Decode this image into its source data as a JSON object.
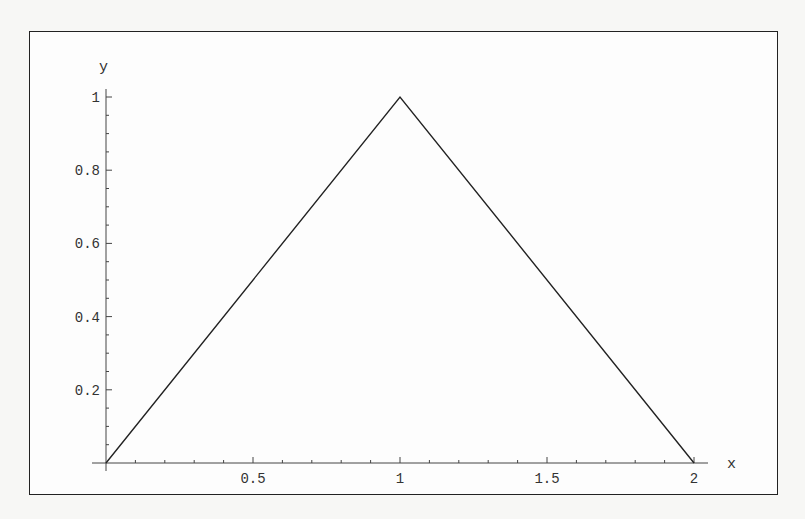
{
  "chart_data": {
    "type": "line",
    "title": "",
    "xlabel": "x",
    "ylabel": "y",
    "xlim": [
      0,
      2
    ],
    "ylim": [
      0,
      1
    ],
    "grid": false,
    "legend": null,
    "x_ticks": [
      "0.5",
      "1",
      "1.5",
      "2"
    ],
    "y_ticks": [
      "0.2",
      "0.4",
      "0.6",
      "0.8",
      "1"
    ],
    "series": [
      {
        "name": "triangle",
        "x": [
          0,
          1,
          2
        ],
        "y": [
          0,
          1,
          0
        ]
      }
    ]
  }
}
